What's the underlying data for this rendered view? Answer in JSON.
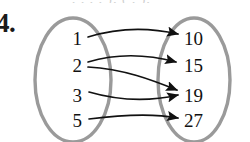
{
  "problem": {
    "number": "4.",
    "top_clipped_fragment": ", ,  ,  ,  ),  (   ,   ),"
  },
  "diagram": {
    "type": "mapping-diagram",
    "ellipse_stroke_color": "#9a9a9a",
    "arrow_color": "#111111",
    "text_color": "#111111",
    "domain_label": "",
    "range_label": "",
    "domain": {
      "values": [
        "1",
        "2",
        "3",
        "5"
      ],
      "positions": [
        {
          "x": 79,
          "y": 38
        },
        {
          "x": 79,
          "y": 65
        },
        {
          "x": 79,
          "y": 95
        },
        {
          "x": 79,
          "y": 120
        }
      ]
    },
    "range": {
      "values": [
        "10",
        "15",
        "19",
        "27"
      ],
      "positions": [
        {
          "x": 196,
          "y": 38
        },
        {
          "x": 196,
          "y": 65
        },
        {
          "x": 196,
          "y": 95
        },
        {
          "x": 196,
          "y": 120
        }
      ]
    },
    "mappings": [
      {
        "from": "1",
        "to": "10"
      },
      {
        "from": "2",
        "to": "15"
      },
      {
        "from": "2",
        "to": "19"
      },
      {
        "from": "3",
        "to": "19"
      },
      {
        "from": "5",
        "to": "27"
      }
    ],
    "ellipses": {
      "left": {
        "cx": 73,
        "cy": 80,
        "rx": 38,
        "ry": 62
      },
      "right": {
        "cx": 194,
        "cy": 80,
        "rx": 36,
        "ry": 62
      }
    }
  }
}
